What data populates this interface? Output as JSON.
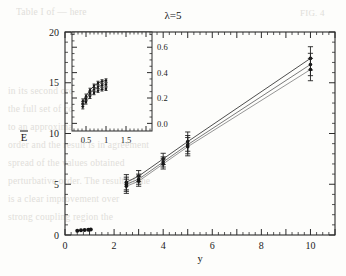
{
  "figure": {
    "title": "λ=5",
    "caption_marker": ""
  },
  "chart_data": {
    "type": "line",
    "title": "λ=5",
    "xlabel": "y",
    "ylabel": "Ē",
    "xlim": [
      0,
      11
    ],
    "ylim": [
      0,
      20
    ],
    "xticks": [
      0,
      2,
      4,
      6,
      8,
      10
    ],
    "xtick_labels": [
      "0",
      "2",
      "4",
      "6",
      "8",
      "10"
    ],
    "yticks": [
      0,
      5,
      10,
      15,
      20
    ],
    "ytick_labels": [
      "0",
      "5",
      "10",
      "15",
      "20"
    ],
    "grid": false,
    "legend": "none",
    "series": [
      {
        "name": "upper",
        "x": [
          2.5,
          3.0,
          4.0,
          5.0,
          10.0
        ],
        "values": [
          5.2,
          5.8,
          7.5,
          9.2,
          17.4
        ],
        "yerr": [
          0.75,
          0.55,
          0.55,
          0.95,
          1.15
        ]
      },
      {
        "name": "middle",
        "x": [
          2.5,
          3.0,
          4.0,
          5.0,
          10.0
        ],
        "values": [
          5.0,
          5.5,
          7.2,
          8.9,
          16.8
        ],
        "yerr": [
          0.7,
          0.5,
          0.5,
          0.9,
          1.1
        ]
      },
      {
        "name": "lower",
        "x": [
          2.5,
          3.0,
          4.0,
          5.0,
          10.0
        ],
        "values": [
          4.8,
          5.3,
          7.0,
          8.7,
          16.3
        ],
        "yerr": [
          0.7,
          0.5,
          0.5,
          0.9,
          1.1
        ]
      },
      {
        "name": "small-y-cluster",
        "x": [
          0.5,
          0.65,
          0.8,
          0.95,
          1.05
        ],
        "values": [
          0.42,
          0.46,
          0.5,
          0.52,
          0.54
        ],
        "yerr": [
          0,
          0,
          0,
          0,
          0
        ]
      }
    ]
  },
  "inset": {
    "type": "line",
    "xlabel": "",
    "ylabel": "",
    "xlim": [
      0.15,
      2.15
    ],
    "ylim": [
      -0.06,
      0.72
    ],
    "xticks": [
      0.5,
      1.0,
      1.5
    ],
    "xtick_labels": [
      "0.5",
      "1",
      "1.5"
    ],
    "yticks": [
      0.0,
      0.2,
      0.4,
      0.6
    ],
    "ytick_labels": [
      "0.0",
      "0.2",
      "0.4",
      "0.6"
    ],
    "ytick_side": "right",
    "grid": false,
    "series": [
      {
        "name": "inset-upper",
        "x": [
          0.42,
          0.5,
          0.6,
          0.7,
          0.8,
          0.9,
          1.0
        ],
        "values": [
          0.175,
          0.215,
          0.262,
          0.296,
          0.318,
          0.331,
          0.338
        ],
        "yerr": [
          0.018,
          0.016,
          0.015,
          0.014,
          0.014,
          0.013,
          0.013
        ]
      },
      {
        "name": "inset-middle",
        "x": [
          0.42,
          0.5,
          0.6,
          0.7,
          0.8,
          0.9,
          1.0
        ],
        "values": [
          0.152,
          0.192,
          0.238,
          0.268,
          0.288,
          0.3,
          0.306
        ],
        "yerr": [
          0.018,
          0.016,
          0.015,
          0.014,
          0.014,
          0.013,
          0.013
        ]
      },
      {
        "name": "inset-lower",
        "x": [
          0.42,
          0.5,
          0.6,
          0.7,
          0.8,
          0.9,
          1.0
        ],
        "values": [
          0.132,
          0.168,
          0.211,
          0.24,
          0.258,
          0.268,
          0.272
        ],
        "yerr": [
          0.018,
          0.016,
          0.015,
          0.014,
          0.014,
          0.013,
          0.013
        ]
      }
    ]
  },
  "background_text": {
    "lines": [
      {
        "text": "FIG. 4",
        "x": 300,
        "y": 8
      },
      {
        "text": "Table I of  —  here",
        "x": 16,
        "y": 7
      },
      {
        "text": "in its second order",
        "x": 8,
        "y": 86
      },
      {
        "text": "the full set of coupling constants",
        "x": 8,
        "y": 104
      },
      {
        "text": "to an approximation involving the",
        "x": 8,
        "y": 122
      },
      {
        "text": "order and the result is in agreement",
        "x": 8,
        "y": 140
      },
      {
        "text": "spread of the values obtained",
        "x": 8,
        "y": 158
      },
      {
        "text": "perturbative order. The result of the",
        "x": 8,
        "y": 176
      },
      {
        "text": "is a clear improvement over",
        "x": 8,
        "y": 194
      },
      {
        "text": "strong coupling region the",
        "x": 8,
        "y": 212
      }
    ]
  },
  "colors": {
    "ink": "#1a1a1a",
    "axis": "#2b2b2b",
    "series_1": "#3a3a3a",
    "series_2": "#6b6b6b",
    "series_3": "#8a8a8a",
    "paper": "#fdfdfb",
    "bleed": "#c9c6c0"
  }
}
